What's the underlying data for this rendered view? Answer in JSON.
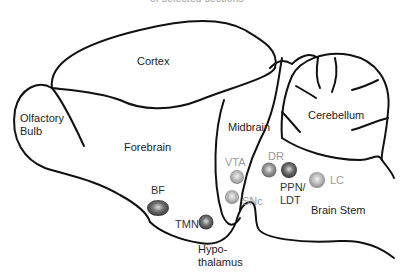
{
  "title": "of selected sections",
  "regions": [
    {
      "id": "cortex",
      "label": "Cortex"
    },
    {
      "id": "olfactory-bulb",
      "label": "Olfactory\nBulb",
      "lines": [
        "Olfactory",
        "Bulb"
      ]
    },
    {
      "id": "forebrain",
      "label": "Forebrain"
    },
    {
      "id": "midbrain",
      "label": "Midbrain"
    },
    {
      "id": "cerebellum",
      "label": "Cerebellum"
    },
    {
      "id": "brain-stem",
      "label": "Brain Stem"
    },
    {
      "id": "hypothalamus",
      "label": "Hypo-\nthalamus",
      "lines": [
        "Hypo-",
        "thalamus"
      ]
    }
  ],
  "nuclei": [
    {
      "id": "bf",
      "label": "BF",
      "shade": "dark",
      "color": "#555555"
    },
    {
      "id": "tmn",
      "label": "TMN",
      "shade": "dark",
      "color": "#444444"
    },
    {
      "id": "vta",
      "label": "VTA",
      "shade": "light",
      "color": "#aaaaaa"
    },
    {
      "id": "snc",
      "label": "SNc",
      "shade": "light",
      "color": "#aaaaaa"
    },
    {
      "id": "dr",
      "label": "DR",
      "shade": "medium",
      "color": "#888888"
    },
    {
      "id": "ppn-ldt",
      "label": "PPN/\nLDT",
      "lines": [
        "PPN/",
        "LDT"
      ],
      "shade": "dark",
      "color": "#444444"
    },
    {
      "id": "lc",
      "label": "LC",
      "shade": "light",
      "color": "#999999"
    }
  ]
}
